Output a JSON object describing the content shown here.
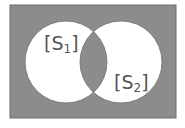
{
  "diagram": {
    "type": "venn",
    "universe": {
      "x": 10,
      "y": 5,
      "width": 166,
      "height": 113,
      "fill": "#8c8c8c",
      "stroke": "#6e6e6e"
    },
    "sets": [
      {
        "name": "S1",
        "label_text": "S",
        "label_sub": "1",
        "cx": 66,
        "cy": 62,
        "r": 41
      },
      {
        "name": "S2",
        "label_text": "S",
        "label_sub": "2",
        "cx": 121,
        "cy": 62,
        "r": 41
      }
    ],
    "shaded_regions": [
      "complement-of-union",
      "intersection"
    ],
    "unshaded_regions": [
      "S1-only",
      "S2-only"
    ],
    "colors": {
      "shade": "#8c8c8c",
      "empty": "#ffffff",
      "outline": "#6e6e6e",
      "label": "#555555"
    },
    "labels": {
      "s1": {
        "open": "[",
        "main": "S",
        "sub": "1",
        "close": "]"
      },
      "s2": {
        "open": "[",
        "main": "S",
        "sub": "2",
        "close": "]"
      }
    }
  }
}
